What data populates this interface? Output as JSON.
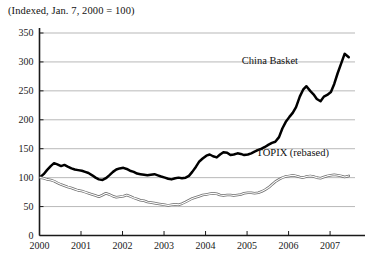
{
  "chart_data": {
    "type": "line",
    "title": "(Indexed, Jan. 7, 2000 = 100)",
    "xlabel": "",
    "ylabel": "",
    "grid": true,
    "legend_position": "inline-annotation",
    "xlim": [
      2000.0,
      2007.6
    ],
    "ylim": [
      0,
      350
    ],
    "y_ticks": [
      0,
      50,
      100,
      150,
      200,
      250,
      300,
      350
    ],
    "x_ticks": [
      2000,
      2001,
      2002,
      2003,
      2004,
      2005,
      2006,
      2007
    ],
    "annotations": [
      {
        "text": "China Basket",
        "x": 2005.55,
        "y": 297
      },
      {
        "text": "TOPIX (rebased)",
        "x": 2006.1,
        "y": 137
      }
    ],
    "series": [
      {
        "name": "China Basket",
        "style": "thick-solid-black",
        "color": "#000000",
        "x": [
          2000.02,
          2000.1,
          2000.18,
          2000.27,
          2000.35,
          2000.43,
          2000.52,
          2000.6,
          2000.68,
          2000.77,
          2000.85,
          2000.93,
          2001.02,
          2001.1,
          2001.18,
          2001.27,
          2001.35,
          2001.43,
          2001.52,
          2001.6,
          2001.68,
          2001.77,
          2001.85,
          2001.93,
          2002.02,
          2002.1,
          2002.18,
          2002.27,
          2002.35,
          2002.43,
          2002.52,
          2002.6,
          2002.68,
          2002.77,
          2002.85,
          2002.93,
          2003.02,
          2003.1,
          2003.18,
          2003.27,
          2003.35,
          2003.43,
          2003.52,
          2003.6,
          2003.68,
          2003.77,
          2003.85,
          2003.93,
          2004.02,
          2004.1,
          2004.18,
          2004.27,
          2004.35,
          2004.43,
          2004.52,
          2004.6,
          2004.68,
          2004.77,
          2004.85,
          2004.93,
          2005.02,
          2005.1,
          2005.18,
          2005.27,
          2005.35,
          2005.43,
          2005.52,
          2005.6,
          2005.68,
          2005.77,
          2005.85,
          2005.93,
          2006.02,
          2006.1,
          2006.18,
          2006.27,
          2006.35,
          2006.43,
          2006.52,
          2006.6,
          2006.68,
          2006.77,
          2006.85,
          2006.93,
          2007.02,
          2007.1,
          2007.18,
          2007.27,
          2007.35,
          2007.45
        ],
        "y": [
          101,
          106,
          113,
          120,
          125,
          123,
          120,
          122,
          119,
          116,
          114,
          113,
          112,
          110,
          108,
          104,
          100,
          97,
          96,
          99,
          104,
          110,
          114,
          116,
          117,
          115,
          112,
          110,
          107,
          106,
          105,
          104,
          105,
          106,
          104,
          102,
          100,
          98,
          97,
          99,
          100,
          99,
          100,
          103,
          110,
          119,
          128,
          133,
          138,
          140,
          137,
          135,
          140,
          144,
          143,
          139,
          140,
          142,
          141,
          139,
          140,
          142,
          145,
          148,
          150,
          153,
          157,
          160,
          162,
          170,
          185,
          196,
          205,
          212,
          222,
          240,
          252,
          258,
          250,
          244,
          236,
          232,
          240,
          243,
          248,
          262,
          280,
          298,
          314,
          308
        ]
      },
      {
        "name": "TOPIX (rebased)",
        "style": "thin-outlined",
        "color": "#6e6e6e",
        "x": [
          2000.02,
          2000.1,
          2000.18,
          2000.27,
          2000.35,
          2000.43,
          2000.52,
          2000.6,
          2000.68,
          2000.77,
          2000.85,
          2000.93,
          2001.02,
          2001.1,
          2001.18,
          2001.27,
          2001.35,
          2001.43,
          2001.52,
          2001.6,
          2001.68,
          2001.77,
          2001.85,
          2001.93,
          2002.02,
          2002.1,
          2002.18,
          2002.27,
          2002.35,
          2002.43,
          2002.52,
          2002.6,
          2002.68,
          2002.77,
          2002.85,
          2002.93,
          2003.02,
          2003.1,
          2003.18,
          2003.27,
          2003.35,
          2003.43,
          2003.52,
          2003.6,
          2003.68,
          2003.77,
          2003.85,
          2003.93,
          2004.02,
          2004.1,
          2004.18,
          2004.27,
          2004.35,
          2004.43,
          2004.52,
          2004.6,
          2004.68,
          2004.77,
          2004.85,
          2004.93,
          2005.02,
          2005.1,
          2005.18,
          2005.27,
          2005.35,
          2005.43,
          2005.52,
          2005.6,
          2005.68,
          2005.77,
          2005.85,
          2005.93,
          2006.02,
          2006.1,
          2006.18,
          2006.27,
          2006.35,
          2006.43,
          2006.52,
          2006.6,
          2006.68,
          2006.77,
          2006.85,
          2006.93,
          2007.02,
          2007.1,
          2007.18,
          2007.27,
          2007.35,
          2007.45
        ],
        "y": [
          100,
          99,
          97,
          96,
          94,
          91,
          88,
          86,
          84,
          82,
          80,
          78,
          77,
          75,
          73,
          71,
          69,
          67,
          70,
          73,
          71,
          68,
          66,
          67,
          68,
          70,
          68,
          65,
          63,
          61,
          60,
          58,
          57,
          56,
          55,
          54,
          53,
          52,
          53,
          54,
          53,
          55,
          58,
          61,
          64,
          66,
          68,
          70,
          71,
          72,
          73,
          72,
          70,
          69,
          70,
          70,
          69,
          70,
          71,
          73,
          74,
          74,
          73,
          74,
          76,
          79,
          83,
          88,
          93,
          97,
          100,
          102,
          103,
          104,
          103,
          101,
          100,
          102,
          103,
          102,
          100,
          99,
          101,
          103,
          104,
          105,
          104,
          103,
          101,
          103
        ]
      }
    ]
  }
}
